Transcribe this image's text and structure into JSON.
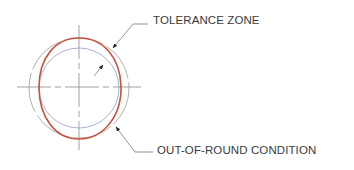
{
  "diagram": {
    "title": "",
    "labels": {
      "tolerance_zone": "TOLERANCE ZONE",
      "out_of_round": "OUT-OF-ROUND CONDITION"
    },
    "colors": {
      "out_of_round_profile": "#c9533a",
      "tolerance_outer_circle": "#9a9a9a",
      "tolerance_inner_circle": "#8fa0c8",
      "centerline": "#8a8a8a",
      "leader": "#7a7a7a",
      "text": "#3a3a3a"
    },
    "elements": [
      {
        "name": "outer-tolerance-circle",
        "type": "dashed-circle"
      },
      {
        "name": "inner-tolerance-circle",
        "type": "circle"
      },
      {
        "name": "out-of-round-profile",
        "type": "ellipse"
      },
      {
        "name": "centerlines",
        "type": "crosshair"
      },
      {
        "name": "tolerance-zone-leader",
        "type": "leader-arrow"
      },
      {
        "name": "out-of-round-leader",
        "type": "leader-arrow"
      }
    ]
  }
}
